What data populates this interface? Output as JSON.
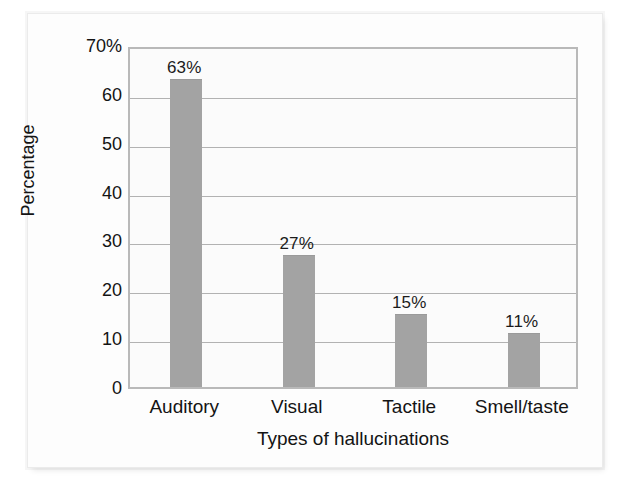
{
  "figure": {
    "background_color": "#ffffff",
    "plate_color": "#fdfdfd"
  },
  "chart_data": {
    "type": "bar",
    "title": "",
    "subtitle": "",
    "categories": [
      "Auditory",
      "Visual",
      "Tactile",
      "Smell/taste"
    ],
    "values": [
      63,
      27,
      15,
      11
    ],
    "data_labels": [
      "63%",
      "27%",
      "15%",
      "11%"
    ],
    "xlabel": "Types of hallucinations",
    "ylabel": "Percentage",
    "ylim": [
      0,
      70
    ],
    "ytick_values": [
      0,
      10,
      20,
      30,
      40,
      50,
      60,
      70
    ],
    "ytick_labels": [
      "0",
      "10",
      "20",
      "30",
      "40",
      "50",
      "60",
      "70%"
    ],
    "grid": true,
    "grid_axis": "y",
    "legend": false,
    "legend_position": "none",
    "bar_color": "#a3a3a3",
    "grid_color": "#b2b2b2",
    "frame_color": "#b9b9b9",
    "plot_background": "#fbfbfb",
    "text_color": "#141414"
  }
}
